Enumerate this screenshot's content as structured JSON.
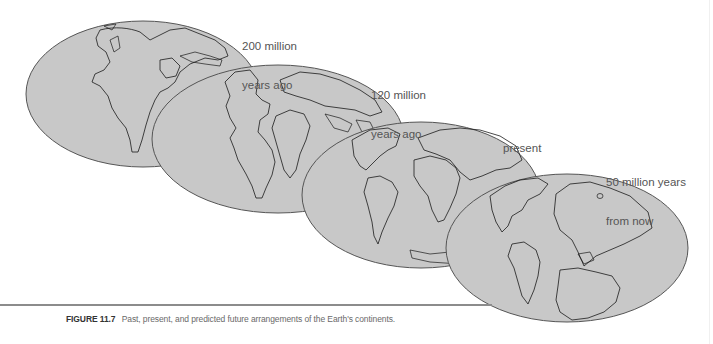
{
  "figure": {
    "caption": {
      "number": "FIGURE 11.7",
      "text": "Past, present, and predicted future arrangements of the Earth's continents."
    },
    "maps": [
      {
        "id": "200mya",
        "label_line1": "200 million",
        "label_line2": "years ago"
      },
      {
        "id": "120mya",
        "label_line1": "120 million",
        "label_line2": "years ago"
      },
      {
        "id": "present",
        "label_line1": "present",
        "label_line2": ""
      },
      {
        "id": "50my-future",
        "label_line1": "50 million years",
        "label_line2": "from now"
      }
    ],
    "colors": {
      "ocean_fill": "#c8c8c8",
      "outline": "#555555",
      "coast": "#1a1a1a",
      "label_text": "#555555"
    }
  }
}
